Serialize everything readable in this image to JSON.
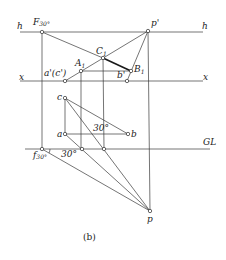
{
  "figure": {
    "caption": "(b)",
    "lines": {
      "h_left": "h",
      "h_right": "h",
      "x_left": "x",
      "x_right": "x",
      "ground_line": "GL"
    },
    "points": {
      "F30": {
        "main": "F",
        "sub": "30°"
      },
      "p_prime": "p'",
      "C1": {
        "main": "C",
        "sub": "1"
      },
      "A1": {
        "main": "A",
        "sub": "1"
      },
      "B1": {
        "main": "B",
        "sub": "1"
      },
      "a_prime_c_prime": "a'(c')",
      "b_prime": "b'",
      "c": "c",
      "a": "a",
      "b": "b",
      "f30": {
        "main": "f",
        "sub": "30°"
      },
      "p": "p"
    },
    "angles": {
      "angle_abc": "30°",
      "angle_gl": "30°"
    }
  }
}
